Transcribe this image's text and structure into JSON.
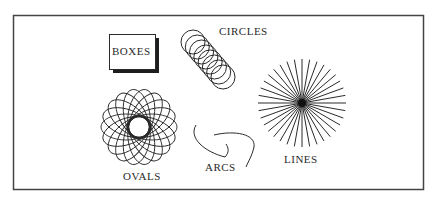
{
  "labels": {
    "boxes": "BOXES",
    "circles": "CIRCLES",
    "ovals": "OVALS",
    "arcs": "ARCS",
    "lines": "LINES"
  },
  "colors": {
    "ink": "#2a2a2a",
    "frame": "#444444",
    "shadow": "#1e1e1e",
    "background": "#ffffff"
  },
  "frame": {
    "x": 13,
    "y": 15,
    "width": 410,
    "height": 174
  },
  "shapes": {
    "boxes": {
      "x": 109,
      "y": 34,
      "width": 46,
      "height": 35,
      "shadow_offset": 4
    },
    "circles": {
      "count": 8,
      "start": [
        193,
        42
      ],
      "end": [
        223,
        77
      ],
      "radius": 12
    },
    "ovals": {
      "center": [
        139,
        127
      ],
      "count": 18,
      "rx": 25,
      "ry": 13,
      "offset": 13
    },
    "lines": {
      "center": [
        302,
        103
      ],
      "count": 36,
      "radius": 44
    }
  }
}
